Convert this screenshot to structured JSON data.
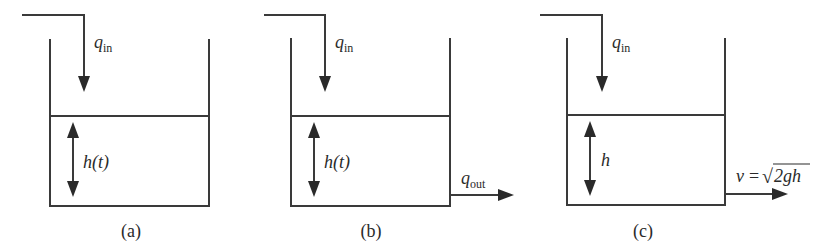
{
  "figure": {
    "panels": [
      {
        "id": "a",
        "caption": "(a)",
        "inflow_label": {
          "symbol": "q",
          "subscript": "in"
        },
        "height_label": "h(t)",
        "outflow": null
      },
      {
        "id": "b",
        "caption": "(b)",
        "inflow_label": {
          "symbol": "q",
          "subscript": "in"
        },
        "height_label": "h(t)",
        "outflow": {
          "symbol": "q",
          "subscript": "out"
        }
      },
      {
        "id": "c",
        "caption": "(c)",
        "inflow_label": {
          "symbol": "q",
          "subscript": "in"
        },
        "height_label": "h",
        "outflow": {
          "lhs": "v",
          "equals": "=",
          "radical": "√",
          "radicand": "2gh"
        }
      }
    ],
    "colors": {
      "ink": "#2a2a2a",
      "background": "#ffffff"
    }
  }
}
